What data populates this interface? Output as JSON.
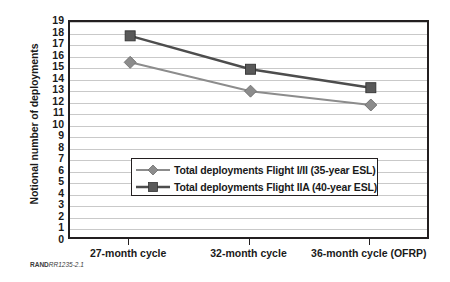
{
  "chart_data": {
    "type": "line",
    "title": "",
    "xlabel": "",
    "ylabel": "Notional number of deployments",
    "categories": [
      "27-month cycle",
      "32-month cycle",
      "36-month cycle (OFRP)"
    ],
    "series": [
      {
        "name": "Total deployments Flight I/II (35-year ESL)",
        "values": [
          15.5,
          13.0,
          11.8
        ],
        "color": "#8c8c8c",
        "marker": "diamond"
      },
      {
        "name": "Total deployments Flight IIA (40-year ESL)",
        "values": [
          17.8,
          14.9,
          13.3
        ],
        "color": "#4d4d4d",
        "marker": "square"
      }
    ],
    "ylim": [
      0,
      19
    ],
    "yticks": [
      0,
      1,
      2,
      3,
      4,
      5,
      6,
      7,
      8,
      9,
      10,
      11,
      12,
      13,
      14,
      15,
      16,
      17,
      18,
      19
    ],
    "ytick_labels": [
      "0",
      "1",
      "2",
      "3",
      "4",
      "5",
      "6",
      "7",
      "8",
      "9",
      "10",
      "11",
      "12",
      "13",
      "14",
      "15",
      "16",
      "17",
      "18",
      "19"
    ],
    "grid": true,
    "grid_color": "#c9c9c9",
    "legend_position": "inside-lower-center",
    "frame_color": "#231f20"
  },
  "footer": {
    "source_prefix": "RAND",
    "source_id": "RR1235-2.1"
  }
}
